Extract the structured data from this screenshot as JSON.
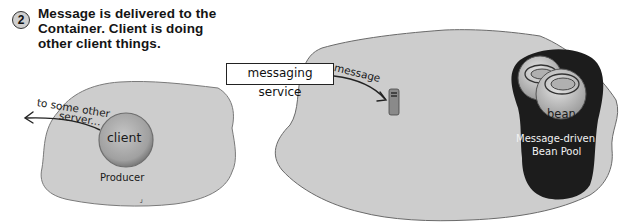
{
  "step": {
    "number": "2",
    "text": "Message is delivered to the Container. Client is doing other client things."
  },
  "producer_side": {
    "client_label": "client",
    "producer_label": "Producer",
    "arrow_label_line1": "to some other",
    "arrow_label_line2": "server..."
  },
  "messaging": {
    "service_label": "messaging service",
    "arrow_label": "message"
  },
  "container_side": {
    "bean_label": "bean",
    "pool_label_line1": "Message-driven",
    "pool_label_line2": "Bean Pool"
  },
  "colors": {
    "blob_fill": "#cdcdcd",
    "blob_stroke": "#6a6a6a",
    "pool_fill": "#1c1c1c",
    "client_fill": "#a8a8a8",
    "bean_fill": "#c8c8c8"
  }
}
